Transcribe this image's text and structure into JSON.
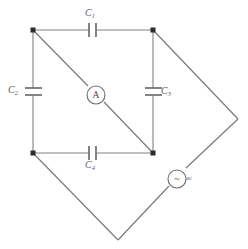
{
  "figure": {
    "background_color": "#ffffff",
    "wire_color": "#808080",
    "node_color": "#2b2b2b",
    "label_color": "#5a5a5a"
  },
  "components": {
    "c1": {
      "name": "C",
      "subscript": "1",
      "type": "capacitor",
      "orientation": "horizontal",
      "position": "top-branch"
    },
    "c2": {
      "name": "C",
      "subscript": "2",
      "type": "capacitor",
      "orientation": "vertical",
      "position": "left-branch"
    },
    "c3": {
      "name": "C",
      "subscript": "3",
      "type": "capacitor",
      "orientation": "vertical",
      "position": "right-branch"
    },
    "c4": {
      "name": "C",
      "subscript": "4",
      "type": "capacitor",
      "orientation": "horizontal",
      "position": "bottom-branch"
    },
    "ammeter": {
      "symbol": "A",
      "type": "ammeter",
      "position": "diagonal-center"
    },
    "source": {
      "symbol": "~",
      "text": "ac",
      "type": "ac-source",
      "position": "outer-right-branch"
    }
  },
  "geometry": {
    "nodes": [
      {
        "id": "top-left",
        "x": 33,
        "y": 30
      },
      {
        "id": "top-right",
        "x": 153,
        "y": 30
      },
      {
        "id": "bottom-left",
        "x": 33,
        "y": 153
      },
      {
        "id": "bottom-right",
        "x": 153,
        "y": 153
      }
    ],
    "outer_vertices": [
      {
        "id": "right-vertex",
        "x": 238,
        "y": 119
      },
      {
        "id": "bottom-vertex",
        "x": 118,
        "y": 240
      }
    ],
    "diagonal": {
      "from": "top-left",
      "to": "bottom-right"
    }
  }
}
